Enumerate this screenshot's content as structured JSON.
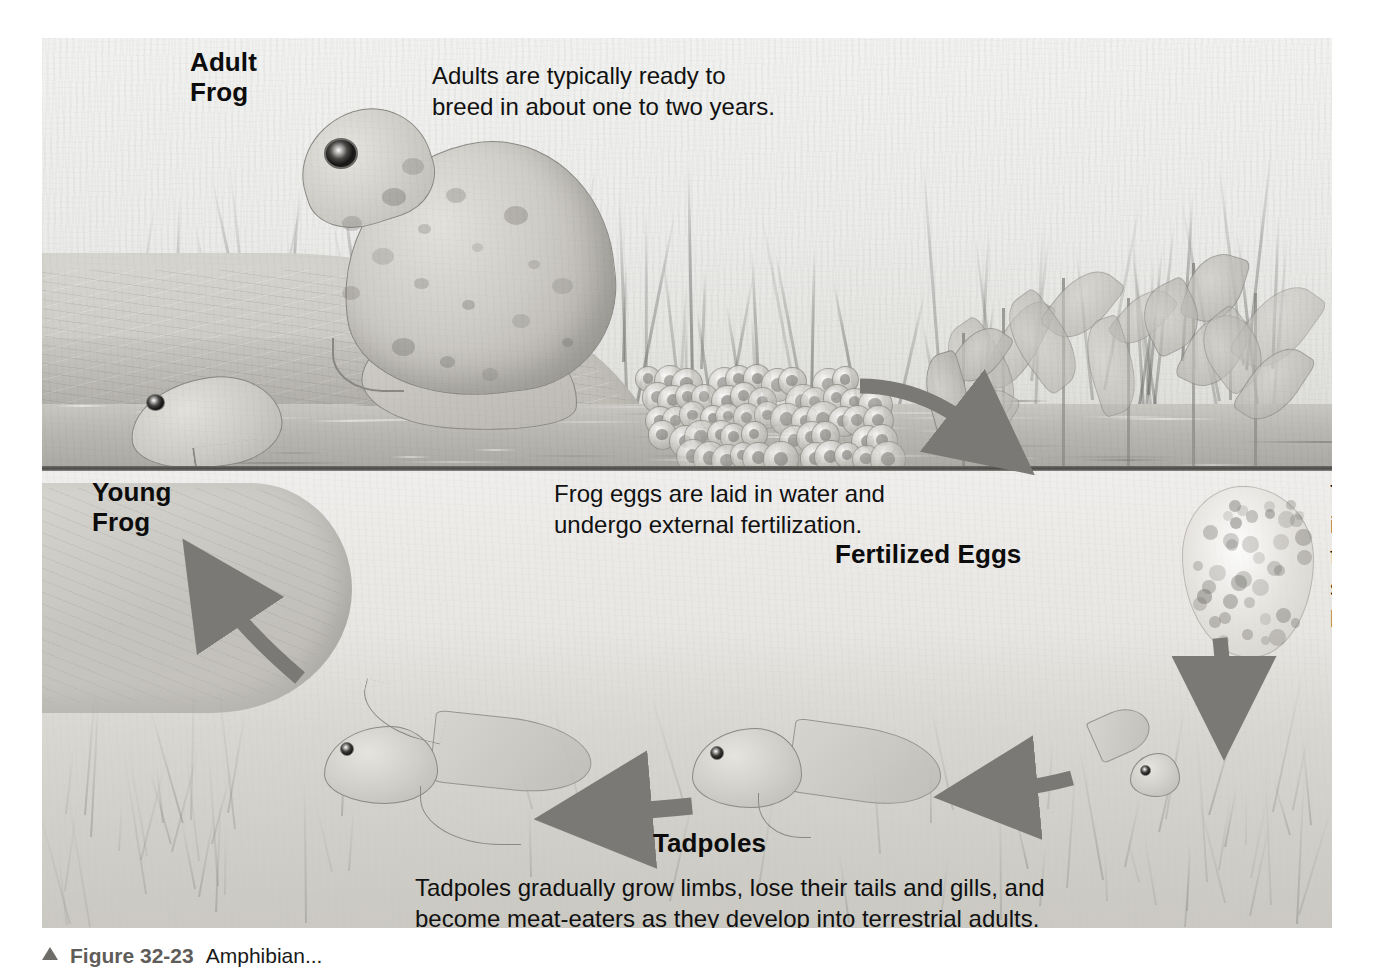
{
  "figure": {
    "caption_marker": "triangle-icon",
    "caption_number": "Figure 32-23",
    "caption_text": "Amphibian..."
  },
  "labels": {
    "adult_frog": "Adult\nFrog",
    "adult_frog_line1": "Adult",
    "adult_frog_line2": "Frog",
    "young_frog_line1": "Young",
    "young_frog_line2": "Frog",
    "fertilized_eggs": "Fertilized Eggs",
    "tadpoles": "Tadpoles"
  },
  "annotations": {
    "adult": {
      "line1": "Adults are typically ready to",
      "line2": "breed in about one to two years."
    },
    "eggs": {
      "line1": "Frog eggs are laid in water and",
      "line2": "undergo external fertilization."
    },
    "hatch": {
      "line1": "The eggs hatch",
      "line2": "into tadpoles a",
      "line3": "few days to",
      "line4": "several weeks",
      "line5": "later."
    },
    "tadpoles": {
      "line1": "Tadpoles gradually grow limbs, lose their tails and gills, and",
      "line2": "become meat-eaters as they develop into terrestrial adults."
    }
  },
  "cycle_stages": [
    {
      "name": "Adult Frog",
      "order": 1
    },
    {
      "name": "Fertilized Eggs",
      "order": 2
    },
    {
      "name": "Tadpoles",
      "order": 3
    },
    {
      "name": "Young Frog",
      "order": 4
    }
  ],
  "arrows": [
    {
      "name": "eggs-to-water-arrow",
      "direction": "right-curved"
    },
    {
      "name": "eggs-to-tadpole-arrow",
      "direction": "down"
    },
    {
      "name": "tadpole-growth-arrow",
      "direction": "left"
    },
    {
      "name": "tadpole-to-young-frog-arrow",
      "direction": "left-curved"
    },
    {
      "name": "young-frog-to-adult-arrow",
      "direction": "up"
    }
  ],
  "colors": {
    "arrow": "#7b7975",
    "text": "#111111",
    "label": "#0c0c0c",
    "waterline": "#4b4a47",
    "background": "#ffffff"
  }
}
